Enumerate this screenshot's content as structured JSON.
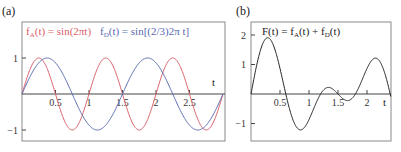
{
  "chart_data": [
    {
      "panel": "(a)",
      "type": "line",
      "title": "",
      "xlabel": "t",
      "ylabel": "",
      "xlim": [
        0,
        3
      ],
      "ylim": [
        -1.3,
        2.0
      ],
      "grid": false,
      "x_ticks": [
        "0.5",
        "1",
        "1.5",
        "2",
        "2.5"
      ],
      "y_ticks": [
        "1",
        "−1"
      ],
      "series": [
        {
          "name": "f_A(t) = sin(2πt)",
          "formula": "sin(2*pi*t)",
          "color": "#d8606a"
        },
        {
          "name": "f_D(t) = sin[(2/3)2π t]",
          "formula": "sin((2/3)*2*pi*t)",
          "color": "#5a6bb0"
        }
      ],
      "legend_position": "top-inside"
    },
    {
      "panel": "(b)",
      "type": "line",
      "title": "F(t) = f_A(t) + f_D(t)",
      "xlabel": "t",
      "ylabel": "",
      "xlim": [
        0,
        2.4
      ],
      "ylim": [
        -1.6,
        2.4
      ],
      "grid": false,
      "x_ticks": [
        "0.5",
        "1",
        "1.5",
        "2"
      ],
      "y_ticks": [
        "2",
        "1",
        "−1"
      ],
      "series": [
        {
          "name": "F(t)",
          "formula": "sin(2*pi*t) + sin((2/3)*2*pi*t)",
          "color": "#222222"
        }
      ]
    }
  ],
  "labels": {
    "panel_a": "(a)",
    "panel_b": "(b)",
    "legend_a_f": "f",
    "legend_a_sub": "A",
    "legend_a_rest": "(t) = sin(2πt)",
    "legend_d_f": "f",
    "legend_d_sub": "D",
    "legend_d_rest": "(t) = sin[(2/3)2π t]",
    "b_title_1": "F(t) = f",
    "b_title_sub1": "A",
    "b_title_2": "(t) + f",
    "b_title_sub2": "D",
    "b_title_3": "(t)",
    "t_axis": "t",
    "a_xticks": [
      "0.5",
      "1",
      "1.5",
      "2",
      "2.5"
    ],
    "a_yticks": [
      "1",
      "−1"
    ],
    "b_xticks": [
      "0.5",
      "1",
      "1.5",
      "2"
    ],
    "b_yticks": [
      "2",
      "1",
      "−1"
    ]
  },
  "colors": {
    "red": "#d8606a",
    "blue": "#5a6bb0",
    "black": "#222222",
    "frame": "#777777"
  }
}
